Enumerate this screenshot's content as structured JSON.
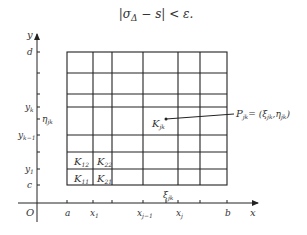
{
  "formula": {
    "abs_open": "|",
    "sigma": "σ",
    "delta_sub": "Δ",
    "rest": " − s",
    "abs_close": "|",
    "lt_eps": " < ε."
  },
  "axes": {
    "y_label": "y",
    "x_label": "x",
    "origin_label": "O",
    "y_ticks": [
      {
        "label": "d",
        "sub": "",
        "y": 52
      },
      {
        "label": "y",
        "sub": "k",
        "y": 107
      },
      {
        "label": "η",
        "sub": "jk",
        "y": 119
      },
      {
        "label": "y",
        "sub": "k−1",
        "y": 135
      },
      {
        "label": "y",
        "sub": "1",
        "y": 169
      },
      {
        "label": "c",
        "sub": "",
        "y": 185
      }
    ],
    "x_ticks": [
      {
        "label": "a",
        "sub": "",
        "x": 67
      },
      {
        "label": "x",
        "sub": "1",
        "x": 93
      },
      {
        "label": "x",
        "sub": "j−1",
        "x": 143
      },
      {
        "label": "x",
        "sub": "j",
        "x": 178
      },
      {
        "label": "b",
        "sub": "",
        "x": 227
      }
    ]
  },
  "grid": {
    "x_lines": [
      67,
      93,
      112,
      143,
      178,
      200,
      227
    ],
    "y_lines": [
      52,
      73,
      94,
      107,
      135,
      152,
      169,
      185
    ],
    "color": "#222222"
  },
  "cells": [
    {
      "label": "K",
      "sub": "12",
      "x": 74,
      "y": 165
    },
    {
      "label": "K",
      "sub": "22",
      "x": 97,
      "y": 165
    },
    {
      "label": "K",
      "sub": "11",
      "x": 74,
      "y": 182
    },
    {
      "label": "K",
      "sub": "21",
      "x": 97,
      "y": 182
    },
    {
      "label": "K",
      "sub": "jk",
      "x": 152,
      "y": 127
    }
  ],
  "point": {
    "label": "P",
    "sub": "jk",
    "eq": "= (ξ",
    "coord_sub1": "jk",
    "comma": ",η",
    "coord_sub2": "jk",
    "close": ")"
  },
  "xi_label": {
    "label": "ξ",
    "sub": "jk"
  }
}
